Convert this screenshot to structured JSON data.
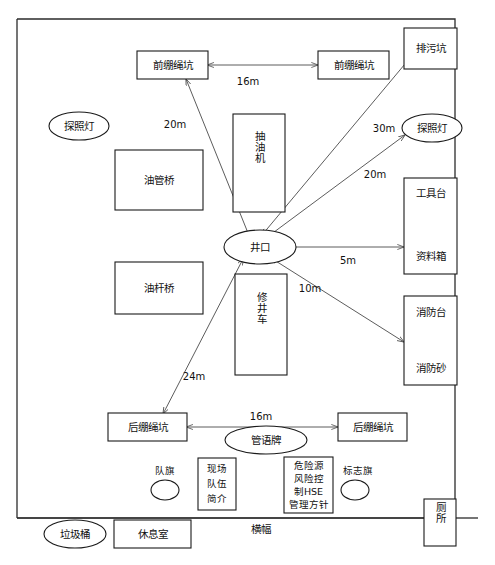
{
  "diagram": {
    "frame": {
      "name": "site-boundary"
    },
    "banner_label": "横幅",
    "units": "m",
    "nodes": [
      {
        "id": "front-guy-pit-left",
        "label": "前绷绳坑",
        "shape": "rect",
        "orient": "horizontal"
      },
      {
        "id": "front-guy-pit-right",
        "label": "前绷绳坑",
        "shape": "rect",
        "orient": "horizontal"
      },
      {
        "id": "sewage-pit",
        "label": "排污坑",
        "shape": "rect",
        "orient": "horizontal"
      },
      {
        "id": "floodlight-left",
        "label": "探照灯",
        "shape": "ellipse",
        "orient": "horizontal"
      },
      {
        "id": "floodlight-right",
        "label": "探照灯",
        "shape": "ellipse",
        "orient": "horizontal"
      },
      {
        "id": "tubing-bridge",
        "label": "油管桥",
        "shape": "rect",
        "orient": "horizontal"
      },
      {
        "id": "rod-bridge",
        "label": "油杆桥",
        "shape": "rect",
        "orient": "horizontal"
      },
      {
        "id": "pumping-unit",
        "label": "抽油机",
        "shape": "rect",
        "orient": "vertical"
      },
      {
        "id": "wellhead",
        "label": "井口",
        "shape": "ellipse",
        "orient": "horizontal"
      },
      {
        "id": "workover-rig",
        "label": "修井车",
        "shape": "rect",
        "orient": "vertical"
      },
      {
        "id": "tool-table",
        "label": "工具台",
        "shape": "rect",
        "orient": "horizontal"
      },
      {
        "id": "data-box",
        "label": "资料箱",
        "shape": "rect",
        "orient": "horizontal"
      },
      {
        "id": "fire-station",
        "label": "消防台",
        "shape": "rect",
        "orient": "horizontal"
      },
      {
        "id": "fire-sand",
        "label": "消防砂",
        "shape": "rect",
        "orient": "horizontal"
      },
      {
        "id": "rear-guy-pit-left",
        "label": "后绷绳坑",
        "shape": "rect",
        "orient": "horizontal"
      },
      {
        "id": "rear-guy-pit-right",
        "label": "后绷绳坑",
        "shape": "rect",
        "orient": "horizontal"
      },
      {
        "id": "slogan-board",
        "label": "管语牌",
        "shape": "ellipse",
        "orient": "horizontal"
      },
      {
        "id": "team-flag",
        "label": "队旗",
        "shape": "circle",
        "orient": "horizontal"
      },
      {
        "id": "marker-flag",
        "label": "标志旗",
        "shape": "circle",
        "orient": "horizontal"
      },
      {
        "id": "team-intro-board",
        "label": "现场队伍简介",
        "lines": [
          "现场",
          "队伍",
          "简介"
        ],
        "shape": "rect",
        "orient": "stacked"
      },
      {
        "id": "hse-policy-board",
        "label": "危险源风险控制HSE管理方针",
        "lines": [
          "危险源",
          "风险控",
          "制HSE",
          "管理方针"
        ],
        "shape": "rect",
        "orient": "stacked"
      },
      {
        "id": "trash-bin",
        "label": "垃圾桶",
        "shape": "ellipse",
        "orient": "horizontal"
      },
      {
        "id": "rest-room",
        "label": "休息室",
        "shape": "rect",
        "orient": "horizontal"
      },
      {
        "id": "toilet",
        "label": "厕所",
        "shape": "rect",
        "orient": "vertical"
      }
    ],
    "dimensions": [
      {
        "id": "dim-front-pits",
        "value": "16m",
        "from": "front-guy-pit-left",
        "to": "front-guy-pit-right"
      },
      {
        "id": "dim-wellhead-fgpl",
        "value": "20m",
        "from": "wellhead",
        "to": "front-guy-pit-left"
      },
      {
        "id": "dim-wellhead-sewage",
        "value": "30m",
        "from": "wellhead",
        "to": "sewage-pit"
      },
      {
        "id": "dim-wellhead-light",
        "value": "20m",
        "from": "wellhead",
        "to": "floodlight-right"
      },
      {
        "id": "dim-wellhead-tools",
        "value": "5m",
        "from": "wellhead",
        "to": "data-box"
      },
      {
        "id": "dim-wellhead-fire",
        "value": "10m",
        "from": "wellhead",
        "to": "fire-sand"
      },
      {
        "id": "dim-wellhead-rgpl",
        "value": "24m",
        "from": "wellhead",
        "to": "rear-guy-pit-left"
      },
      {
        "id": "dim-rear-pits",
        "value": "16m",
        "from": "rear-guy-pit-left",
        "to": "rear-guy-pit-right"
      }
    ]
  }
}
